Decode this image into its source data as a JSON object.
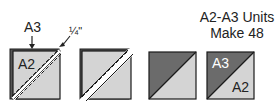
{
  "title": {
    "line1": "A2-A3 Units",
    "line2": "Make 48"
  },
  "step1": {
    "top_label": "A3",
    "square_label": "A2",
    "seam_allowance_label": "¼\"",
    "arrow_top": "arrow-down-icon",
    "arrow_seam": "arrow-diagonal-icon"
  },
  "step2": {
    "description": "squares cut apart between stitching lines"
  },
  "step3": {
    "description": "half-square triangle pressed open"
  },
  "step4": {
    "upper_label": "A3",
    "lower_label": "A2"
  },
  "colors": {
    "dark_fabric": "#6b6b6b",
    "light_fabric": "#d4d4d4",
    "outline": "#1a1a1a"
  }
}
